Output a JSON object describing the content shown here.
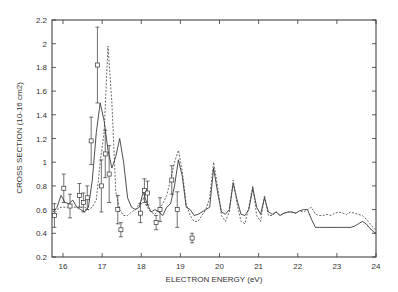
{
  "chart_data": {
    "type": "line",
    "title": "",
    "xlabel": "ELECTRON ENERGY (eV)",
    "ylabel": "CROSS SECTION (10-16 cm2)",
    "xlim": [
      15.75,
      24
    ],
    "ylim": [
      0.2,
      2.2
    ],
    "xticks": [
      16,
      17,
      18,
      19,
      20,
      21,
      22,
      23,
      24
    ],
    "yticks": [
      0.2,
      0.4,
      0.6,
      0.8,
      1,
      1.2,
      1.4,
      1.6,
      1.8,
      2,
      2.2
    ],
    "ytick_labels": [
      "0.2",
      "0.4",
      "0.6",
      "0.8",
      "1",
      "1.2",
      "1.4",
      "1.6",
      "1.8",
      "2",
      "2.2"
    ],
    "grid": false,
    "legend": null,
    "series": [
      {
        "name": "solid",
        "style": "solid",
        "color": "#222222",
        "x": [
          15.75,
          15.85,
          15.95,
          16.05,
          16.15,
          16.25,
          16.35,
          16.45,
          16.55,
          16.65,
          16.75,
          16.85,
          16.95,
          17.05,
          17.15,
          17.25,
          17.35,
          17.45,
          17.55,
          17.65,
          17.75,
          17.85,
          17.95,
          18.05,
          18.15,
          18.25,
          18.35,
          18.45,
          18.55,
          18.65,
          18.75,
          18.85,
          18.95,
          19.05,
          19.15,
          19.25,
          19.35,
          19.45,
          19.55,
          19.65,
          19.75,
          19.85,
          19.95,
          20.05,
          20.15,
          20.25,
          20.35,
          20.45,
          20.55,
          20.65,
          20.75,
          20.85,
          20.95,
          21.05,
          21.15,
          21.25,
          21.35,
          21.45,
          21.55,
          21.65,
          21.75,
          21.85,
          21.95,
          22.05,
          22.15,
          22.25,
          22.35,
          22.45,
          22.55,
          22.65,
          22.75,
          22.85,
          22.95,
          23.05,
          23.15,
          23.25,
          23.35,
          23.45,
          23.55,
          23.65,
          23.75,
          23.85,
          23.95,
          24.0
        ],
        "y": [
          0.58,
          0.62,
          0.72,
          0.66,
          0.65,
          0.68,
          0.62,
          0.6,
          0.58,
          0.62,
          0.85,
          1.25,
          1.5,
          1.35,
          1.1,
          0.95,
          1.05,
          1.2,
          1.0,
          0.7,
          0.62,
          0.6,
          0.62,
          0.75,
          0.65,
          0.58,
          0.6,
          0.58,
          0.55,
          0.62,
          0.65,
          0.8,
          1.02,
          0.88,
          0.62,
          0.6,
          0.55,
          0.56,
          0.58,
          0.6,
          0.62,
          0.95,
          0.75,
          0.58,
          0.56,
          0.6,
          0.82,
          0.68,
          0.56,
          0.55,
          0.6,
          0.78,
          0.62,
          0.56,
          0.7,
          0.58,
          0.56,
          0.58,
          0.55,
          0.57,
          0.58,
          0.58,
          0.57,
          0.59,
          0.6,
          0.6,
          0.52,
          0.45,
          0.45,
          0.45,
          0.45,
          0.45,
          0.45,
          0.45,
          0.45,
          0.45,
          0.45,
          0.46,
          0.48,
          0.5,
          0.48,
          0.44,
          0.41,
          0.4
        ]
      },
      {
        "name": "dashed",
        "style": "dashed",
        "color": "#444444",
        "x": [
          15.75,
          15.85,
          15.95,
          16.05,
          16.15,
          16.25,
          16.35,
          16.45,
          16.55,
          16.65,
          16.75,
          16.85,
          16.95,
          17.05,
          17.15,
          17.25,
          17.35,
          17.45,
          17.55,
          17.65,
          17.75,
          17.85,
          17.95,
          18.05,
          18.15,
          18.25,
          18.35,
          18.45,
          18.55,
          18.65,
          18.75,
          18.85,
          18.95,
          19.05,
          19.15,
          19.25,
          19.35,
          19.45,
          19.55,
          19.65,
          19.75,
          19.85,
          19.95,
          20.05,
          20.15,
          20.25,
          20.35,
          20.45,
          20.55,
          20.65,
          20.75,
          20.85,
          20.95,
          21.05,
          21.15,
          21.25,
          21.35,
          21.45,
          21.55,
          21.65,
          21.75,
          21.85,
          21.95,
          22.05,
          22.15,
          22.25,
          22.35,
          22.45,
          22.55,
          22.65,
          22.75,
          22.85,
          22.95,
          23.05,
          23.15,
          23.25,
          23.35,
          23.45,
          23.55,
          23.65,
          23.75,
          23.85,
          23.95,
          24.0
        ],
        "y": [
          0.55,
          0.6,
          0.62,
          0.62,
          0.62,
          0.62,
          0.62,
          0.62,
          0.62,
          0.6,
          0.62,
          0.68,
          1.0,
          1.25,
          1.98,
          1.5,
          0.75,
          0.6,
          0.55,
          0.55,
          0.58,
          0.6,
          0.65,
          0.7,
          0.62,
          0.58,
          0.56,
          0.6,
          0.65,
          0.72,
          0.85,
          1.0,
          1.1,
          0.92,
          0.65,
          0.55,
          0.5,
          0.5,
          0.55,
          0.6,
          0.7,
          1.0,
          0.8,
          0.55,
          0.5,
          0.58,
          0.85,
          0.65,
          0.5,
          0.48,
          0.62,
          0.8,
          0.55,
          0.5,
          0.72,
          0.55,
          0.55,
          0.58,
          0.55,
          0.57,
          0.58,
          0.58,
          0.57,
          0.59,
          0.58,
          0.6,
          0.62,
          0.56,
          0.55,
          0.55,
          0.56,
          0.55,
          0.57,
          0.58,
          0.57,
          0.56,
          0.58,
          0.57,
          0.56,
          0.55,
          0.52,
          0.48,
          0.44,
          0.43
        ]
      },
      {
        "name": "experiment",
        "style": "markers-errorbars",
        "marker": "square",
        "color": "#333333",
        "x": [
          15.78,
          16.02,
          16.18,
          16.42,
          16.52,
          16.62,
          16.72,
          16.88,
          16.98,
          17.08,
          17.18,
          17.4,
          17.48,
          17.98,
          18.08,
          18.16,
          18.38,
          18.48,
          18.78,
          18.92,
          19.3
        ],
        "y": [
          0.55,
          0.78,
          0.63,
          0.72,
          0.66,
          0.7,
          1.18,
          1.82,
          0.8,
          1.07,
          0.9,
          0.6,
          0.43,
          0.57,
          0.76,
          0.74,
          0.49,
          0.6,
          0.85,
          0.6,
          0.36
        ],
        "yerr": [
          0.1,
          0.12,
          0.1,
          0.1,
          0.08,
          0.1,
          0.2,
          0.32,
          0.22,
          0.2,
          0.24,
          0.12,
          0.06,
          0.08,
          0.1,
          0.1,
          0.06,
          0.1,
          0.12,
          0.15,
          0.04
        ]
      }
    ]
  }
}
